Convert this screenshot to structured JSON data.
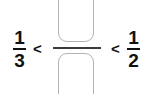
{
  "problem": {
    "type": "fraction-comparison",
    "background_color": "#ffffff",
    "text_color": "#111111",
    "box_border_color": "#b4b4b4",
    "bar_color": "#3a3a3a",
    "left_fraction": {
      "numerator": "1",
      "denominator": "3",
      "label": "one third"
    },
    "right_fraction": {
      "numerator": "1",
      "denominator": "2",
      "label": "one half"
    },
    "answer_fraction": {
      "numerator_value": "",
      "numerator_placeholder": "",
      "denominator_value": "",
      "denominator_placeholder": "",
      "label": "unknown fraction"
    },
    "operators": {
      "left": "<",
      "right": "<"
    }
  }
}
